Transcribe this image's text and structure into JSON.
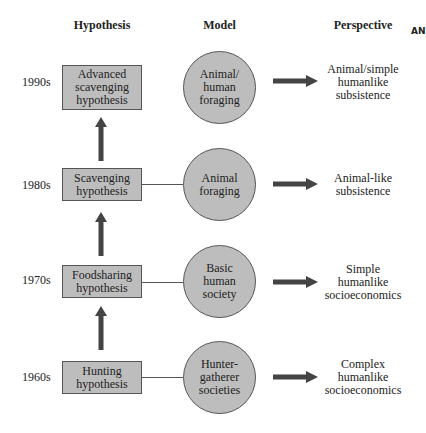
{
  "headers": {
    "hypothesis": "Hypothesis",
    "model": "Model",
    "perspective": "Perspective",
    "corner_text": "AN"
  },
  "rows": [
    {
      "decade": "1990s",
      "hypothesis": [
        "Advanced",
        "scavenging",
        "hypothesis"
      ],
      "model": [
        "Animal/",
        "human",
        "foraging"
      ],
      "perspective": [
        "Animal/simple",
        "humanlike",
        "subsistence"
      ]
    },
    {
      "decade": "1980s",
      "hypothesis": [
        "Scavenging",
        "hypothesis"
      ],
      "model": [
        "Animal",
        "foraging"
      ],
      "perspective": [
        "Animal-like",
        "subsistence"
      ]
    },
    {
      "decade": "1970s",
      "hypothesis": [
        "Foodsharing",
        "hypothesis"
      ],
      "model": [
        "Basic",
        "human",
        "society"
      ],
      "perspective": [
        "Simple",
        "humanlike",
        "socioeconomics"
      ]
    },
    {
      "decade": "1960s",
      "hypothesis": [
        "Hunting",
        "hypothesis"
      ],
      "model": [
        "Hunter-",
        "gatherer",
        "societies"
      ],
      "perspective": [
        "Complex",
        "humanlike",
        "socioeconomics"
      ]
    }
  ],
  "colors": {
    "shape_fill": "#bdbdbd",
    "arrow": "#444444",
    "border": "#555555"
  }
}
